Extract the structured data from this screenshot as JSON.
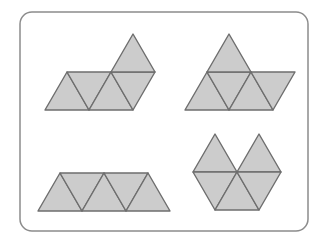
{
  "figure": {
    "canvas": {
      "width": 328,
      "height": 245,
      "background": "#ffffff"
    },
    "frame": {
      "name": "rounded-rectangle-border",
      "x": 20,
      "y": 12,
      "width": 288,
      "height": 219,
      "corner_radius": 12,
      "stroke": "#8c8c8c",
      "stroke_width": 1.5,
      "fill": "#ffffff"
    },
    "style": {
      "triangle_fill": "#cccccc",
      "triangle_stroke": "#6e6e6e",
      "triangle_stroke_width": 1.4,
      "triangle_side": 44,
      "triangle_height": 38
    },
    "shapes": [
      {
        "name": "shape-top-left",
        "label": "Top-left net",
        "triangle_count": 5,
        "description": "Row of four triangles (up, down, up, down) with a fifth upward triangle resting on top of the fourth cell",
        "triangles": [
          {
            "name": "triangle-1-up",
            "orientation": "up",
            "points": "45,110 67,72 89,110"
          },
          {
            "name": "triangle-2-down",
            "orientation": "down",
            "points": "67,72 111,72 89,110"
          },
          {
            "name": "triangle-3-up",
            "orientation": "up",
            "points": "89,110 111,72 133,110"
          },
          {
            "name": "triangle-4-down",
            "orientation": "down",
            "points": "111,72 155,72 133,110"
          },
          {
            "name": "triangle-5-up",
            "orientation": "up",
            "points": "111,72 133,34 155,72"
          }
        ]
      },
      {
        "name": "shape-top-right",
        "label": "Top-right net",
        "triangle_count": 5,
        "description": "Row of four triangles (up, down, up, down) with a fifth upward triangle sitting on top of the second cell",
        "triangles": [
          {
            "name": "triangle-1-up",
            "orientation": "up",
            "points": "185,110 207,72 229,110"
          },
          {
            "name": "triangle-2-down",
            "orientation": "down",
            "points": "207,72 251,72 229,110"
          },
          {
            "name": "triangle-3-up",
            "orientation": "up",
            "points": "229,110 251,72 273,110"
          },
          {
            "name": "triangle-4-down",
            "orientation": "down",
            "points": "251,72 295,72 273,110"
          },
          {
            "name": "triangle-5-up",
            "orientation": "up",
            "points": "207,72 229,34 251,72"
          }
        ]
      },
      {
        "name": "shape-bottom-left",
        "label": "Bottom-left net",
        "triangle_count": 5,
        "description": "Trapezoid strip of five triangles in one row (up, down, up, down, up)",
        "triangles": [
          {
            "name": "triangle-1-up",
            "orientation": "up",
            "points": "38,211 60,173 82,211"
          },
          {
            "name": "triangle-2-down",
            "orientation": "down",
            "points": "60,173 104,173 82,211"
          },
          {
            "name": "triangle-3-up",
            "orientation": "up",
            "points": "82,211 104,173 126,211"
          },
          {
            "name": "triangle-4-down",
            "orientation": "down",
            "points": "104,173 148,173 126,211"
          },
          {
            "name": "triangle-5-up",
            "orientation": "up",
            "points": "126,211 148,173 170,211"
          }
        ]
      },
      {
        "name": "shape-bottom-right",
        "label": "Bottom-right net",
        "triangle_count": 5,
        "description": "Butterfly shape: two upward triangles on the upper row separated by a notch, above a trapezoid of three triangles (down, up, down)",
        "triangles": [
          {
            "name": "triangle-1-up",
            "orientation": "up",
            "points": "193,172 215,134 237,172"
          },
          {
            "name": "triangle-2-up",
            "orientation": "up",
            "points": "237,172 259,134 281,172"
          },
          {
            "name": "triangle-3-down",
            "orientation": "down",
            "points": "193,172 237,172 215,210"
          },
          {
            "name": "triangle-4-up",
            "orientation": "up",
            "points": "215,210 237,172 259,210"
          },
          {
            "name": "triangle-5-down",
            "orientation": "down",
            "points": "237,172 281,172 259,210"
          }
        ]
      }
    ]
  }
}
